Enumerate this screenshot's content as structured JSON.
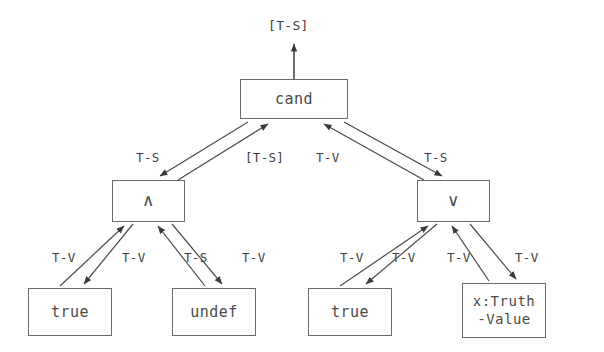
{
  "diagram": {
    "type": "attribute-grammar-dependency-tree",
    "background_color": "#ffffff",
    "line_color": "#4a4a4a",
    "box_border_color": "#6b6b6b",
    "text_color": "#4a4a4a",
    "root_output_label": "[T-S]",
    "nodes": [
      {
        "id": "cand",
        "label": "cand",
        "x": 240,
        "y": 79,
        "w": 108,
        "h": 40
      },
      {
        "id": "and",
        "label": "∧",
        "x": 112,
        "y": 180,
        "w": 73,
        "h": 42
      },
      {
        "id": "or",
        "label": "∨",
        "x": 417,
        "y": 180,
        "w": 73,
        "h": 42
      },
      {
        "id": "leaf1",
        "label": "true",
        "x": 28,
        "y": 288,
        "w": 84,
        "h": 48
      },
      {
        "id": "leaf2",
        "label": "undef",
        "x": 172,
        "y": 288,
        "w": 84,
        "h": 48
      },
      {
        "id": "leaf3",
        "label": "true",
        "x": 308,
        "y": 288,
        "w": 84,
        "h": 48
      },
      {
        "id": "leaf4",
        "label_line1": "x:Truth",
        "label_line2": "-Value",
        "x": 462,
        "y": 283,
        "w": 84,
        "h": 55
      }
    ],
    "edge_labels": [
      {
        "id": "e-and-up",
        "text": "T-S",
        "x": 136,
        "y": 150
      },
      {
        "id": "e-and-down",
        "text": "[T-S]",
        "x": 245,
        "y": 150
      },
      {
        "id": "e-or-up",
        "text": "T-V",
        "x": 316,
        "y": 150
      },
      {
        "id": "e-or-down",
        "text": "T-S",
        "x": 424,
        "y": 150
      },
      {
        "id": "e-leaf1-up",
        "text": "T-V",
        "x": 52,
        "y": 250
      },
      {
        "id": "e-leaf1-dn",
        "text": "T-V",
        "x": 122,
        "y": 250
      },
      {
        "id": "e-leaf2-up",
        "text": "T-S",
        "x": 184,
        "y": 250
      },
      {
        "id": "e-leaf2-dn",
        "text": "T-V",
        "x": 242,
        "y": 250
      },
      {
        "id": "e-leaf3-up",
        "text": "T-V",
        "x": 340,
        "y": 250
      },
      {
        "id": "e-leaf3-dn",
        "text": "T-V",
        "x": 392,
        "y": 250
      },
      {
        "id": "e-leaf4-up",
        "text": "T-V",
        "x": 447,
        "y": 250
      },
      {
        "id": "e-leaf4-dn",
        "text": "T-V",
        "x": 515,
        "y": 250
      }
    ]
  }
}
